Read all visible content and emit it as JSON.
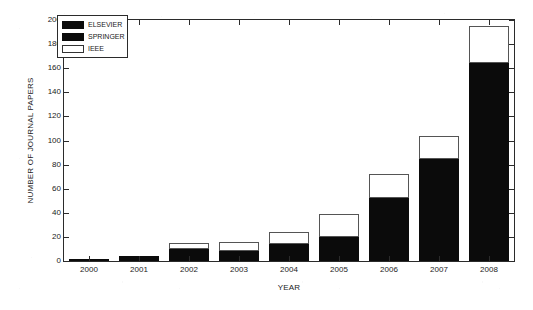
{
  "chart_data": {
    "type": "bar",
    "stacked": true,
    "title": "",
    "xlabel": "YEAR",
    "ylabel": "NUMBER OF JOURNAL PAPERS",
    "categories": [
      "2000",
      "2001",
      "2002",
      "2003",
      "2004",
      "2005",
      "2006",
      "2007",
      "2008"
    ],
    "series": [
      {
        "name": "ELSEVIER",
        "color": "#0b0b0b",
        "values": [
          0,
          2,
          5,
          4,
          7,
          10,
          26,
          43,
          80
        ]
      },
      {
        "name": "SPRINGER",
        "color": "#0b0b0b",
        "values": [
          1,
          2,
          5,
          4,
          7,
          10,
          26,
          42,
          84
        ]
      },
      {
        "name": "IEEE",
        "color": "#ffffff",
        "values": [
          0,
          0,
          5,
          8,
          10,
          19,
          20,
          19,
          31
        ]
      }
    ],
    "stack_totals": [
      1,
      4,
      15,
      16,
      24,
      39,
      72,
      104,
      195
    ],
    "dark_totals": [
      1,
      4,
      10,
      8,
      14,
      20,
      52,
      85,
      164
    ],
    "ylim": [
      0,
      200
    ],
    "ytick_step": 20,
    "yticks": [
      "0",
      "20",
      "40",
      "60",
      "80",
      "100",
      "120",
      "140",
      "160",
      "180",
      "200"
    ],
    "grid": false,
    "legend_position": "top-left",
    "legend": [
      "ELSEVIER",
      "SPRINGER",
      "IEEE"
    ]
  },
  "axes": {
    "y_title": "NUMBER OF JOURNAL PAPERS",
    "x_title": "YEAR"
  },
  "legend": {
    "items": [
      {
        "label": "ELSEVIER",
        "swatch": "dark"
      },
      {
        "label": "SPRINGER",
        "swatch": "dark"
      },
      {
        "label": "IEEE",
        "swatch": "light"
      }
    ]
  }
}
